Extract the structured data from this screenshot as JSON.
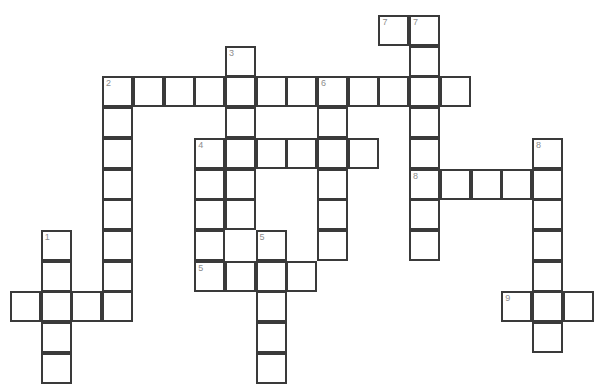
{
  "puzzle": {
    "type": "crossword-grid",
    "title": "",
    "cell_size": 30.7,
    "origin": {
      "x": 10,
      "y": 15
    },
    "grid_cols": 20,
    "grid_rows": 12,
    "border_color": "#3a3a3a",
    "cell_fill": "#ffffff",
    "number_color": "#8d8d8d",
    "entries": [
      {
        "number": "1",
        "direction": "down",
        "col": 1,
        "row": 7,
        "length": 4
      },
      {
        "number": "1",
        "direction": "across",
        "col": 0,
        "row": 9,
        "length": 4
      },
      {
        "number": "2",
        "direction": "across",
        "col": 3,
        "row": 2,
        "length": 12
      },
      {
        "number": "2",
        "direction": "down",
        "col": 3,
        "row": 2,
        "length": 9
      },
      {
        "number": "3",
        "direction": "down",
        "col": 7,
        "row": 1,
        "length": 6
      },
      {
        "number": "4",
        "direction": "across",
        "col": 6,
        "row": 4,
        "length": 6
      },
      {
        "number": "4",
        "direction": "down",
        "col": 6,
        "row": 4,
        "length": 5
      },
      {
        "number": "5",
        "direction": "down",
        "col": 8,
        "row": 7,
        "length": 5
      },
      {
        "number": "5",
        "direction": "across",
        "col": 6,
        "row": 8,
        "length": 4
      },
      {
        "number": "6",
        "direction": "across",
        "col": 10,
        "row": 2,
        "length": 5
      },
      {
        "number": "6",
        "direction": "down",
        "col": 10,
        "row": 2,
        "length": 6
      },
      {
        "number": "7",
        "direction": "across",
        "col": 12,
        "row": 0,
        "length": 2
      },
      {
        "number": "7",
        "direction": "down",
        "col": 13,
        "row": 0,
        "length": 8
      },
      {
        "number": "8",
        "direction": "across",
        "col": 13,
        "row": 5,
        "length": 5
      },
      {
        "number": "8",
        "direction": "down",
        "col": 17,
        "row": 4,
        "length": 6
      },
      {
        "number": "9",
        "direction": "across",
        "col": 16,
        "row": 9,
        "length": 3
      }
    ],
    "cells": [
      {
        "col": 12,
        "row": 0,
        "num": "7"
      },
      {
        "col": 13,
        "row": 0,
        "num": "7"
      },
      {
        "col": 7,
        "row": 1,
        "num": "3"
      },
      {
        "col": 13,
        "row": 1,
        "num": ""
      },
      {
        "col": 3,
        "row": 2,
        "num": "2"
      },
      {
        "col": 4,
        "row": 2,
        "num": ""
      },
      {
        "col": 5,
        "row": 2,
        "num": ""
      },
      {
        "col": 6,
        "row": 2,
        "num": ""
      },
      {
        "col": 7,
        "row": 2,
        "num": ""
      },
      {
        "col": 8,
        "row": 2,
        "num": ""
      },
      {
        "col": 9,
        "row": 2,
        "num": ""
      },
      {
        "col": 10,
        "row": 2,
        "num": "6"
      },
      {
        "col": 11,
        "row": 2,
        "num": ""
      },
      {
        "col": 12,
        "row": 2,
        "num": ""
      },
      {
        "col": 13,
        "row": 2,
        "num": ""
      },
      {
        "col": 14,
        "row": 2,
        "num": ""
      },
      {
        "col": 3,
        "row": 3,
        "num": ""
      },
      {
        "col": 7,
        "row": 3,
        "num": ""
      },
      {
        "col": 10,
        "row": 3,
        "num": ""
      },
      {
        "col": 13,
        "row": 3,
        "num": ""
      },
      {
        "col": 3,
        "row": 4,
        "num": ""
      },
      {
        "col": 6,
        "row": 4,
        "num": "4"
      },
      {
        "col": 7,
        "row": 4,
        "num": ""
      },
      {
        "col": 8,
        "row": 4,
        "num": ""
      },
      {
        "col": 9,
        "row": 4,
        "num": ""
      },
      {
        "col": 10,
        "row": 4,
        "num": ""
      },
      {
        "col": 11,
        "row": 4,
        "num": ""
      },
      {
        "col": 13,
        "row": 4,
        "num": ""
      },
      {
        "col": 17,
        "row": 4,
        "num": "8"
      },
      {
        "col": 3,
        "row": 5,
        "num": ""
      },
      {
        "col": 6,
        "row": 5,
        "num": ""
      },
      {
        "col": 7,
        "row": 5,
        "num": ""
      },
      {
        "col": 10,
        "row": 5,
        "num": ""
      },
      {
        "col": 13,
        "row": 5,
        "num": "8"
      },
      {
        "col": 14,
        "row": 5,
        "num": ""
      },
      {
        "col": 15,
        "row": 5,
        "num": ""
      },
      {
        "col": 16,
        "row": 5,
        "num": ""
      },
      {
        "col": 17,
        "row": 5,
        "num": ""
      },
      {
        "col": 3,
        "row": 6,
        "num": ""
      },
      {
        "col": 6,
        "row": 6,
        "num": ""
      },
      {
        "col": 7,
        "row": 6,
        "num": ""
      },
      {
        "col": 10,
        "row": 6,
        "num": ""
      },
      {
        "col": 13,
        "row": 6,
        "num": ""
      },
      {
        "col": 17,
        "row": 6,
        "num": ""
      },
      {
        "col": 1,
        "row": 7,
        "num": "1"
      },
      {
        "col": 3,
        "row": 7,
        "num": ""
      },
      {
        "col": 6,
        "row": 7,
        "num": ""
      },
      {
        "col": 8,
        "row": 7,
        "num": "5"
      },
      {
        "col": 10,
        "row": 7,
        "num": ""
      },
      {
        "col": 13,
        "row": 7,
        "num": ""
      },
      {
        "col": 17,
        "row": 7,
        "num": ""
      },
      {
        "col": 1,
        "row": 8,
        "num": ""
      },
      {
        "col": 3,
        "row": 8,
        "num": ""
      },
      {
        "col": 6,
        "row": 8,
        "num": "5"
      },
      {
        "col": 7,
        "row": 8,
        "num": ""
      },
      {
        "col": 8,
        "row": 8,
        "num": ""
      },
      {
        "col": 9,
        "row": 8,
        "num": ""
      },
      {
        "col": 17,
        "row": 8,
        "num": ""
      },
      {
        "col": 0,
        "row": 9,
        "num": ""
      },
      {
        "col": 1,
        "row": 9,
        "num": ""
      },
      {
        "col": 2,
        "row": 9,
        "num": ""
      },
      {
        "col": 3,
        "row": 9,
        "num": ""
      },
      {
        "col": 8,
        "row": 9,
        "num": ""
      },
      {
        "col": 16,
        "row": 9,
        "num": "9"
      },
      {
        "col": 17,
        "row": 9,
        "num": ""
      },
      {
        "col": 18,
        "row": 9,
        "num": ""
      },
      {
        "col": 1,
        "row": 10,
        "num": ""
      },
      {
        "col": 8,
        "row": 10,
        "num": ""
      },
      {
        "col": 17,
        "row": 10,
        "num": ""
      },
      {
        "col": 1,
        "row": 11,
        "num": ""
      },
      {
        "col": 8,
        "row": 11,
        "num": ""
      }
    ]
  }
}
